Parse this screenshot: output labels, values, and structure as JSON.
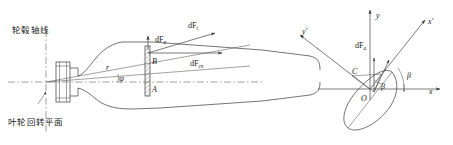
{
  "figure": {
    "background": "#ffffff",
    "line_color": "#3a3a3a"
  },
  "left_view": {
    "name": "blade planform with hub",
    "labels": {
      "hub_axis": "轮毂轴线",
      "rotation_plane": "叶轮回转平面",
      "radius": "r",
      "sweep_angle": "ψ",
      "point_upper": "B",
      "point_lower": "A"
    },
    "forces": [
      {
        "id": "dFa",
        "base": "dF",
        "sub": "a",
        "label": "dFₐ"
      },
      {
        "id": "dFt",
        "base": "dF",
        "sub": "t",
        "label": "dFₜ"
      },
      {
        "id": "dFcn",
        "base": "dF",
        "sub": "cn",
        "label": "dFᶜⁿ"
      }
    ]
  },
  "right_view": {
    "name": "airfoil section with coordinate systems",
    "axes": [
      {
        "id": "x",
        "label": "x",
        "type": "global"
      },
      {
        "id": "y",
        "label": "y",
        "type": "global"
      },
      {
        "id": "xp",
        "label": "x'",
        "type": "local"
      },
      {
        "id": "yp",
        "label": "y'",
        "type": "local"
      }
    ],
    "labels": {
      "origin": "O",
      "point_c": "C",
      "angle_inner": "β",
      "angle_outer": "β"
    },
    "forces": [
      {
        "id": "dFa",
        "base": "dF",
        "sub": "a",
        "label": "dFₐ"
      }
    ]
  }
}
